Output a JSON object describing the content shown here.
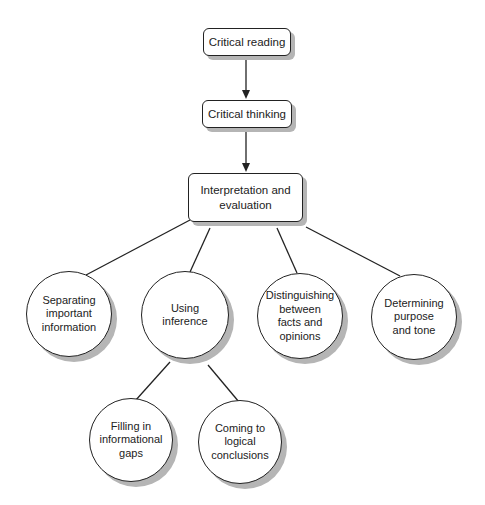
{
  "diagram": {
    "type": "hierarchy",
    "nodes": {
      "critical_reading": "Critical reading",
      "critical_thinking": "Critical thinking",
      "interpretation": "Interpretation and\nevaluation",
      "separating": "Separating\nimportant\ninformation",
      "using_inference": "Using\ninference",
      "distinguishing": "Distinguishing\nbetween\nfacts and\nopinions",
      "determining": "Determining\npurpose\nand tone",
      "filling": "Filling in\ninformational\ngaps",
      "coming": "Coming to\nlogical\nconclusions"
    },
    "edges": [
      {
        "from": "critical_reading",
        "to": "critical_thinking",
        "arrow": true
      },
      {
        "from": "critical_thinking",
        "to": "interpretation",
        "arrow": true
      },
      {
        "from": "interpretation",
        "to": "separating",
        "arrow": false
      },
      {
        "from": "interpretation",
        "to": "using_inference",
        "arrow": false
      },
      {
        "from": "interpretation",
        "to": "distinguishing",
        "arrow": false
      },
      {
        "from": "interpretation",
        "to": "determining",
        "arrow": false
      },
      {
        "from": "using_inference",
        "to": "filling",
        "arrow": false
      },
      {
        "from": "using_inference",
        "to": "coming",
        "arrow": false
      }
    ]
  }
}
